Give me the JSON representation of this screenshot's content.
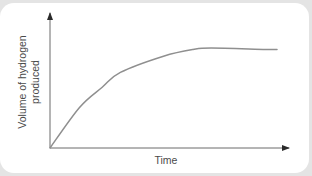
{
  "chart_data": {
    "type": "line",
    "title": "",
    "xlabel": "Time",
    "ylabel": "Volume of hydrogen produced",
    "ylabel_lines": [
      "Volume of hydrogen",
      "produced"
    ],
    "grid": false,
    "legend": null,
    "axis_ticks": false,
    "series": [
      {
        "name": "Volume of hydrogen produced",
        "x": [
          0,
          0.13,
          0.23,
          0.31,
          0.5,
          0.63,
          0.71,
          0.95,
          1.0
        ],
        "y": [
          0,
          0.3,
          0.45,
          0.56,
          0.68,
          0.73,
          0.74,
          0.73,
          0.73
        ]
      }
    ],
    "xlim": [
      0,
      1
    ],
    "ylim": [
      0,
      1
    ],
    "colors": {
      "curve": "#8f8f8f",
      "axes": "#3a3a3a",
      "text": "#4a4a4a"
    }
  }
}
